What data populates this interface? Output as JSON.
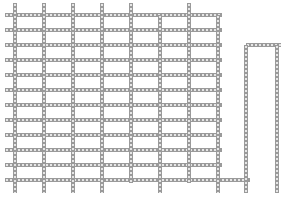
{
  "diagram": {
    "track_color": "#9a9a9a",
    "hole_color": "#e6e6e6",
    "background": "#ffffff",
    "track_width": 4,
    "horizontal_tracks": [
      {
        "y": 15,
        "x1": 5,
        "x2": 222
      },
      {
        "y": 30,
        "x1": 5,
        "x2": 222
      },
      {
        "y": 45,
        "x1": 5,
        "x2": 222
      },
      {
        "y": 60,
        "x1": 5,
        "x2": 222
      },
      {
        "y": 75,
        "x1": 5,
        "x2": 222
      },
      {
        "y": 90,
        "x1": 5,
        "x2": 222
      },
      {
        "y": 105,
        "x1": 5,
        "x2": 222
      },
      {
        "y": 120,
        "x1": 5,
        "x2": 222
      },
      {
        "y": 135,
        "x1": 5,
        "x2": 222
      },
      {
        "y": 150,
        "x1": 5,
        "x2": 222
      },
      {
        "y": 165,
        "x1": 5,
        "x2": 222
      },
      {
        "y": 180,
        "x1": 5,
        "x2": 250
      },
      {
        "y": 45,
        "x1": 246,
        "x2": 281
      }
    ],
    "vertical_tracks": [
      {
        "x": 15,
        "y1": 3,
        "y2": 193
      },
      {
        "x": 44,
        "y1": 3,
        "y2": 193
      },
      {
        "x": 73,
        "y1": 3,
        "y2": 193
      },
      {
        "x": 102,
        "y1": 3,
        "y2": 193
      },
      {
        "x": 131,
        "y1": 3,
        "y2": 183
      },
      {
        "x": 160,
        "y1": 15,
        "y2": 193
      },
      {
        "x": 189,
        "y1": 3,
        "y2": 183
      },
      {
        "x": 218,
        "y1": 15,
        "y2": 193
      },
      {
        "x": 246,
        "y1": 45,
        "y2": 193
      },
      {
        "x": 277,
        "y1": 45,
        "y2": 193
      }
    ]
  }
}
